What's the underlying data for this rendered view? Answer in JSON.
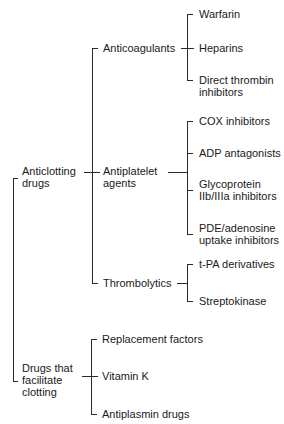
{
  "diagram": {
    "type": "tree",
    "root_groups": [
      {
        "label_line1": "Anticlotting",
        "label_line2": "drugs",
        "children": [
          {
            "label": "Anticoagulants",
            "children": [
              {
                "label": "Warfarin"
              },
              {
                "label": "Heparins"
              },
              {
                "label_line1": "Direct thrombin",
                "label_line2": "inhibitors"
              }
            ]
          },
          {
            "label_line1": "Antiplatelet",
            "label_line2": "agents",
            "children": [
              {
                "label": "COX inhibitors"
              },
              {
                "label": "ADP antagonists"
              },
              {
                "label_line1": "Glycoprotein",
                "label_line2": "IIb/IIIa inhibitors"
              },
              {
                "label_line1": "PDE/adenosine",
                "label_line2": "uptake inhibitors"
              }
            ]
          },
          {
            "label": "Thrombolytics",
            "children": [
              {
                "label": "t-PA derivatives"
              },
              {
                "label": "Streptokinase"
              }
            ]
          }
        ]
      },
      {
        "label_line1": "Drugs that",
        "label_line2": "facilitate",
        "label_line3": "clotting",
        "children": [
          {
            "label": "Replacement factors"
          },
          {
            "label": "Vitamin K"
          },
          {
            "label": "Antiplasmin drugs"
          }
        ]
      }
    ]
  }
}
